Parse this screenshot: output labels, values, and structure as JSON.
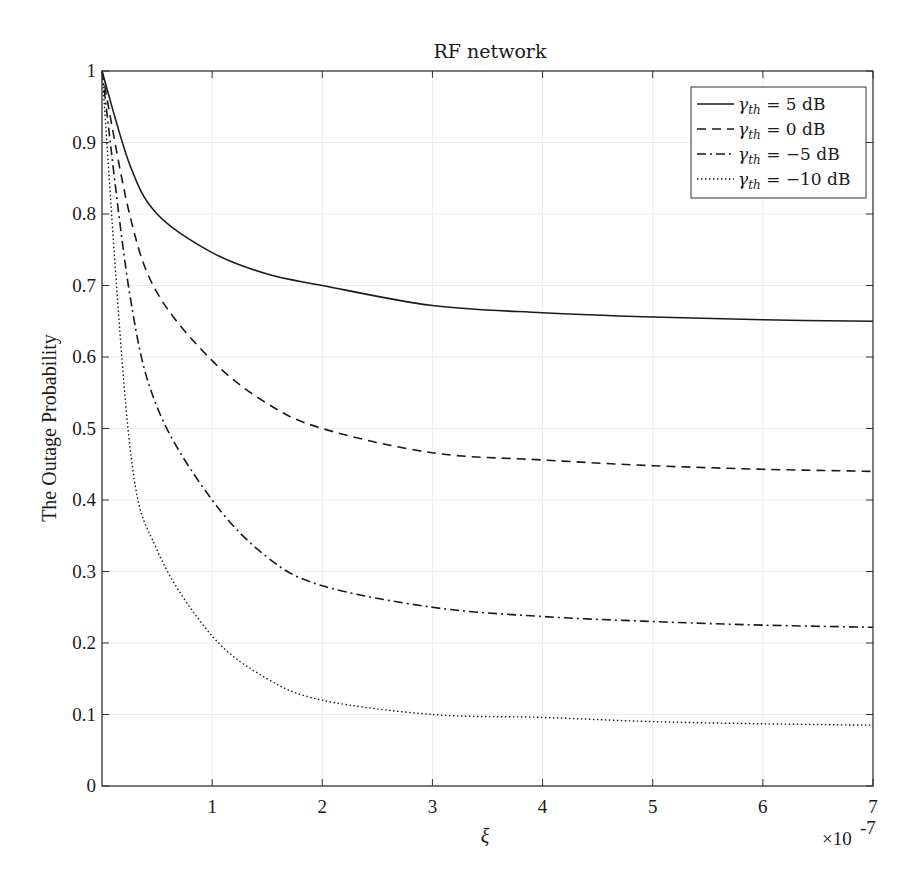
{
  "chart_data": {
    "type": "line",
    "title": "RF network",
    "xlabel": "ξ",
    "ylabel": "The Outage Probability",
    "x_multiplier": "×10",
    "x_multiplier_exp": "-7",
    "xlim": [
      0,
      7
    ],
    "ylim": [
      0,
      1
    ],
    "x_ticks": [
      "1",
      "2",
      "3",
      "4",
      "5",
      "6",
      "7"
    ],
    "y_ticks": [
      "0",
      "0.1",
      "0.2",
      "0.3",
      "0.4",
      "0.5",
      "0.6",
      "0.7",
      "0.8",
      "0.9",
      "1"
    ],
    "grid": true,
    "legend_position": "upper right",
    "x": [
      0,
      0.25,
      0.5,
      1,
      1.5,
      2,
      3,
      4,
      5,
      6,
      7
    ],
    "series": [
      {
        "name": "γth = 5 dB",
        "legend_var": "γ",
        "legend_sub": "th",
        "legend_rest": " = 5 dB",
        "style": "solid",
        "values": [
          1.0,
          0.87,
          0.8,
          0.746,
          0.716,
          0.7,
          0.672,
          0.662,
          0.656,
          0.652,
          0.65
        ]
      },
      {
        "name": "γth = 0 dB",
        "legend_var": "γ",
        "legend_sub": "th",
        "legend_rest": " = 0 dB",
        "style": "dashed",
        "values": [
          1.0,
          0.8,
          0.69,
          0.595,
          0.535,
          0.5,
          0.466,
          0.456,
          0.448,
          0.443,
          0.44
        ]
      },
      {
        "name": "γth = −5 dB",
        "legend_var": "γ",
        "legend_sub": "th",
        "legend_rest": " = −5 dB",
        "style": "dashdot",
        "values": [
          1.0,
          0.69,
          0.53,
          0.4,
          0.32,
          0.28,
          0.25,
          0.237,
          0.23,
          0.225,
          0.222
        ]
      },
      {
        "name": "γth = −10 dB",
        "legend_var": "γ",
        "legend_sub": "th",
        "legend_rest": " = −10 dB",
        "style": "dotted",
        "values": [
          1.0,
          0.48,
          0.33,
          0.21,
          0.15,
          0.12,
          0.1,
          0.096,
          0.09,
          0.087,
          0.085
        ]
      }
    ]
  }
}
